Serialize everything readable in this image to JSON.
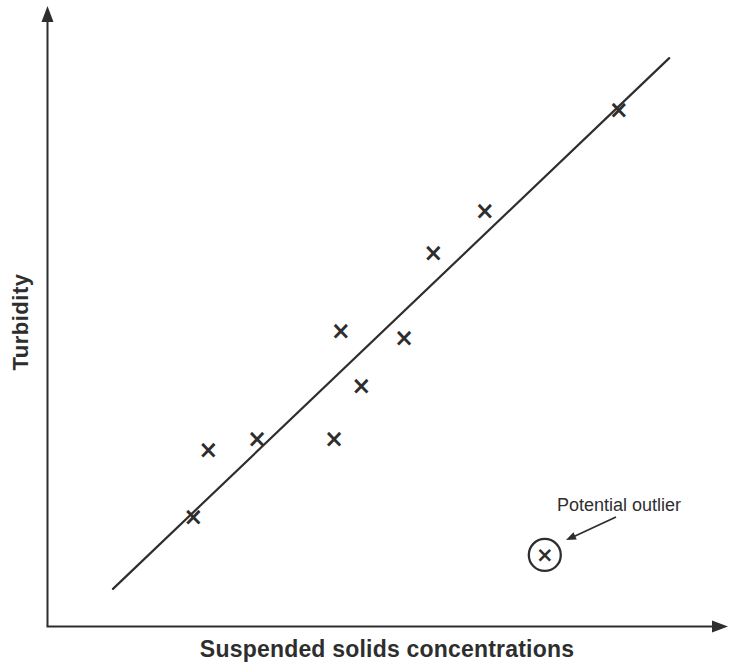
{
  "figure": {
    "background": "#ffffff",
    "ink_color": "#2e2e2e"
  },
  "chart_data": {
    "type": "scatter",
    "title": "",
    "xlabel": "Suspended solids concentrations",
    "ylabel": "Turbidity",
    "xlim": [
      0,
      100
    ],
    "ylim": [
      0,
      100
    ],
    "grid": false,
    "legend": "none",
    "axes_style": "arrow-tipped axes, no tick labels (conceptual sketch)",
    "marker_glyph": "×",
    "points": [
      {
        "x": 21.5,
        "y": 17.6
      },
      {
        "x": 23.7,
        "y": 28.5
      },
      {
        "x": 30.9,
        "y": 30.3
      },
      {
        "x": 42.2,
        "y": 30.3
      },
      {
        "x": 43.2,
        "y": 47.7
      },
      {
        "x": 46.2,
        "y": 38.8
      },
      {
        "x": 52.5,
        "y": 46.6
      },
      {
        "x": 56.8,
        "y": 60.4
      },
      {
        "x": 64.4,
        "y": 67.2
      },
      {
        "x": 84.1,
        "y": 83.5
      }
    ],
    "trend_line": {
      "x1": 9.7,
      "y1": 6.0,
      "x2": 91.5,
      "y2": 91.9
    },
    "outlier": {
      "x": 73.2,
      "y": 11.5,
      "circled": true
    },
    "annotation": {
      "text": "Potential outlier"
    }
  }
}
